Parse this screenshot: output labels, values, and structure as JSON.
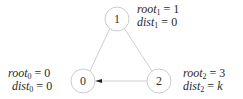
{
  "diagram": {
    "type": "graph",
    "nodes": [
      {
        "id": "0",
        "label": "0",
        "root_var": "root",
        "root_sub": "0",
        "root_val": "0",
        "dist_var": "dist",
        "dist_sub": "0",
        "dist_val": "0"
      },
      {
        "id": "1",
        "label": "1",
        "root_var": "root",
        "root_sub": "1",
        "root_val": "1",
        "dist_var": "dist",
        "dist_sub": "1",
        "dist_val": "0"
      },
      {
        "id": "2",
        "label": "2",
        "root_var": "root",
        "root_sub": "2",
        "root_val": "3",
        "dist_var": "dist",
        "dist_sub": "2",
        "dist_val": "k"
      }
    ],
    "edges": [
      {
        "from": "1",
        "to": "0",
        "directed": false
      },
      {
        "from": "1",
        "to": "2",
        "directed": false
      },
      {
        "from": "2",
        "to": "0",
        "directed": true
      }
    ],
    "colors": {
      "edge": "#c8c8c8",
      "node_border": "#cccccc",
      "arrow": "#222222",
      "text": "#2a2a2a"
    }
  }
}
